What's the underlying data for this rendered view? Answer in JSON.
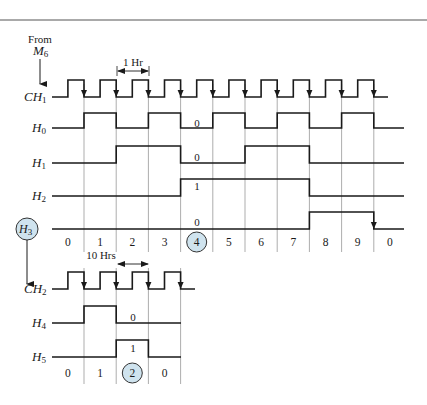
{
  "source": {
    "label_line1": "From",
    "label_line2_main": "M",
    "label_line2_sub": "6"
  },
  "colors": {
    "highlight_circle": "#cfe3ee",
    "line": "#1a1a1a",
    "grid": "#8a8a8a"
  },
  "top_section": {
    "period_label": "1 Hr",
    "signals": [
      {
        "id": "CH1",
        "main": "CH",
        "sub": "1",
        "type": "clock"
      },
      {
        "id": "H0",
        "main": "H",
        "sub": "0",
        "levels": [
          0,
          1,
          0,
          1,
          0,
          1,
          0,
          1,
          0,
          1,
          0
        ]
      },
      {
        "id": "H1",
        "main": "H",
        "sub": "1",
        "levels": [
          0,
          0,
          1,
          1,
          0,
          0,
          1,
          1,
          0,
          0,
          0
        ]
      },
      {
        "id": "H2",
        "main": "H",
        "sub": "2",
        "levels": [
          0,
          0,
          0,
          0,
          1,
          1,
          1,
          1,
          0,
          0,
          0
        ]
      },
      {
        "id": "H3",
        "main": "H",
        "sub": "3",
        "levels": [
          0,
          0,
          0,
          0,
          0,
          0,
          0,
          0,
          1,
          1,
          0
        ],
        "highlighted": true
      }
    ],
    "annotations": {
      "H0": "0",
      "H1": "0",
      "H2": "1",
      "H3": "0"
    },
    "counts": [
      "0",
      "1",
      "2",
      "3",
      "4",
      "5",
      "6",
      "7",
      "8",
      "9",
      "0"
    ],
    "highlighted_count_index": 4
  },
  "bottom_section": {
    "period_label": "10 Hrs",
    "signals": [
      {
        "id": "CH2",
        "main": "CH",
        "sub": "2",
        "type": "clock"
      },
      {
        "id": "H4",
        "main": "H",
        "sub": "4",
        "levels": [
          0,
          1,
          0,
          0
        ]
      },
      {
        "id": "H5",
        "main": "H",
        "sub": "5",
        "levels": [
          0,
          0,
          1,
          0
        ]
      }
    ],
    "annotations": {
      "H4": "0",
      "H5": "1"
    },
    "counts": [
      "0",
      "1",
      "2",
      "0"
    ],
    "highlighted_count_index": 2
  }
}
